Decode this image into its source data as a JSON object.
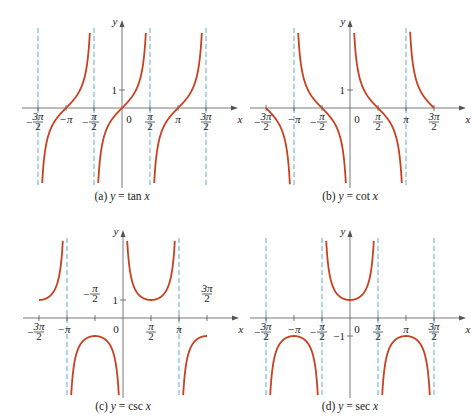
{
  "colors": {
    "curve": "#C9401F",
    "asymptote": "#5FA8D6",
    "axis": "#555555",
    "text": "#222222"
  },
  "chart_data": [
    {
      "type": "line",
      "title": "(a) y = tan x",
      "caption_prefix": "(a)",
      "caption_func": "y = tan x",
      "xlabel": "x",
      "ylabel": "y",
      "x_ticks": [
        "-3π/2",
        "-π",
        "-π/2",
        "0",
        "π/2",
        "π",
        "3π/2"
      ],
      "y_ticks": [
        "1"
      ],
      "asymptotes": [
        "-3π/2",
        "-π/2",
        "π/2",
        "3π/2"
      ],
      "function": "tan",
      "xlim": [
        "-3π/2",
        "3π/2"
      ],
      "grid": false
    },
    {
      "type": "line",
      "title": "(b) y = cot x",
      "caption_prefix": "(b)",
      "caption_func": "y = cot x",
      "xlabel": "x",
      "ylabel": "y",
      "x_ticks": [
        "-3π/2",
        "-π",
        "-π/2",
        "0",
        "π/2",
        "π",
        "3π/2"
      ],
      "y_ticks": [
        "1"
      ],
      "asymptotes": [
        "-π",
        "0",
        "π"
      ],
      "function": "cot",
      "xlim": [
        "-3π/2",
        "3π/2"
      ],
      "grid": false
    },
    {
      "type": "line",
      "title": "(c) y = csc x",
      "caption_prefix": "(c)",
      "caption_func": "y = csc x",
      "xlabel": "x",
      "ylabel": "y",
      "x_ticks": [
        "-3π/2",
        "-π",
        "-π/2",
        "0",
        "π/2",
        "π",
        "3π/2"
      ],
      "y_ticks": [
        "1"
      ],
      "asymptotes": [
        "-π",
        "π"
      ],
      "function": "csc",
      "xlim": [
        "-3π/2",
        "3π/2"
      ],
      "grid": false
    },
    {
      "type": "line",
      "title": "(d) y = sec x",
      "caption_prefix": "(d)",
      "caption_func": "y = sec x",
      "xlabel": "x",
      "ylabel": "y",
      "x_ticks": [
        "-3π/2",
        "-π",
        "-π/2",
        "0",
        "π/2",
        "π",
        "3π/2"
      ],
      "y_ticks": [
        "-1"
      ],
      "asymptotes": [
        "-3π/2",
        "-π/2",
        "π/2",
        "3π/2"
      ],
      "function": "sec",
      "xlim": [
        "-3π/2",
        "3π/2"
      ],
      "grid": false
    }
  ],
  "labels": {
    "x": "x",
    "y": "y",
    "zero": "0",
    "one": "1",
    "neg_one": "−1",
    "pi": "π",
    "neg": "−",
    "two": "2",
    "three_pi": "3π"
  }
}
